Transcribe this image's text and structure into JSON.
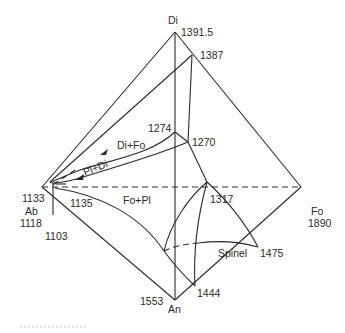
{
  "diagram": {
    "type": "phase-diagram-tetrahedron",
    "vertices": {
      "top": {
        "name": "Di",
        "temp": "1391.5"
      },
      "left": {
        "name": "Ab",
        "temp_upper": "1133",
        "temp_lower": "1118"
      },
      "right": {
        "name": "Fo",
        "temp": "1890"
      },
      "bottom": {
        "name": "An",
        "temp": "1553"
      }
    },
    "points": {
      "p1387": "1387",
      "p1274": "1274",
      "p1270": "1270",
      "p1135": "1135",
      "p1103": "1103",
      "p1317": "1317",
      "p1475": "1475",
      "p1444": "1444"
    },
    "fields": {
      "di_fo": "Di+Fo",
      "pl_di": "Pl+Di",
      "fo_pl": "Fo+Pl",
      "spinel": "Spinel"
    }
  }
}
